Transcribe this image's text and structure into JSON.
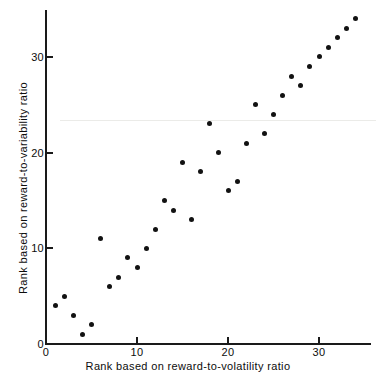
{
  "chart_data": {
    "type": "scatter",
    "title": "",
    "xlabel": "Rank based on reward-to-volatility ratio",
    "ylabel": "Rank based on reward-to-variability ratio",
    "xlim": [
      0,
      35.8
    ],
    "ylim": [
      0,
      35
    ],
    "xticks": [
      0,
      10,
      20,
      30
    ],
    "yticks": [
      0,
      10,
      20,
      30
    ],
    "xtick_labels": [
      "0",
      "10",
      "20",
      "30"
    ],
    "ytick_labels": [
      "0",
      "10",
      "20",
      "30"
    ],
    "grid": false,
    "legend": null,
    "marker": "filled-circle",
    "marker_color": "#121212",
    "points": [
      {
        "x": 1,
        "y": 4
      },
      {
        "x": 2,
        "y": 5
      },
      {
        "x": 3,
        "y": 3
      },
      {
        "x": 4,
        "y": 1
      },
      {
        "x": 5,
        "y": 2
      },
      {
        "x": 6,
        "y": 11
      },
      {
        "x": 7,
        "y": 6
      },
      {
        "x": 8,
        "y": 7
      },
      {
        "x": 9,
        "y": 9
      },
      {
        "x": 10,
        "y": 8
      },
      {
        "x": 11,
        "y": 10
      },
      {
        "x": 12,
        "y": 12
      },
      {
        "x": 13,
        "y": 15
      },
      {
        "x": 14,
        "y": 14
      },
      {
        "x": 15,
        "y": 19
      },
      {
        "x": 16,
        "y": 13
      },
      {
        "x": 17,
        "y": 18
      },
      {
        "x": 18,
        "y": 23
      },
      {
        "x": 19,
        "y": 20
      },
      {
        "x": 20,
        "y": 16
      },
      {
        "x": 21,
        "y": 17
      },
      {
        "x": 22,
        "y": 21
      },
      {
        "x": 23,
        "y": 25
      },
      {
        "x": 24,
        "y": 22
      },
      {
        "x": 25,
        "y": 24
      },
      {
        "x": 26,
        "y": 26
      },
      {
        "x": 27,
        "y": 28
      },
      {
        "x": 28,
        "y": 27
      },
      {
        "x": 29,
        "y": 29
      },
      {
        "x": 30,
        "y": 30
      },
      {
        "x": 31,
        "y": 31
      },
      {
        "x": 32,
        "y": 32
      },
      {
        "x": 33,
        "y": 33
      },
      {
        "x": 34,
        "y": 34
      }
    ]
  },
  "axes": {
    "x_title": "Rank based on reward-to-volatility ratio",
    "y_title": "Rank based on reward-to-variability ratio"
  },
  "colors": {
    "marker": "#121212",
    "axis": "#1a1a1a",
    "text": "#0d0d0d",
    "background": "#ffffff"
  }
}
